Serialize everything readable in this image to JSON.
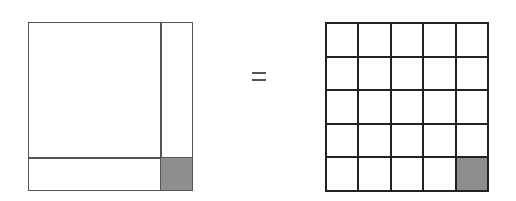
{
  "diagram": {
    "left_figure": {
      "type": "partitioned-square",
      "regions": [
        "large-square",
        "right-strip",
        "bottom-strip",
        "corner-square"
      ],
      "shaded_region": "corner-square",
      "shade_color": "#8e8e8e",
      "line_color": "#555555"
    },
    "operator": "=",
    "right_figure": {
      "type": "grid",
      "rows": 5,
      "cols": 5,
      "shaded_cells": [
        [
          4,
          4
        ]
      ],
      "shade_color": "#8e8e8e",
      "line_color": "#222222"
    }
  }
}
